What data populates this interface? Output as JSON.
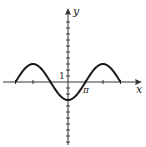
{
  "chart_data": {
    "type": "line",
    "title": "",
    "function": "y = -3 cos(x/2)",
    "xlabel": "x",
    "ylabel": "y",
    "x_tick_label": "π",
    "y_tick_label": "1",
    "xlim": [
      -3.5,
      4.0
    ],
    "ylim": [
      -7.5,
      7.2
    ],
    "x_tick_step_pi": 1,
    "y_tick_step": 1,
    "domain_pi": [
      -3,
      3
    ],
    "series": [
      {
        "name": "curve",
        "x_pi": [
          -3,
          -2,
          -1,
          0,
          1,
          2,
          3
        ],
        "values": [
          0,
          3,
          0,
          -3,
          0,
          3,
          0
        ]
      }
    ],
    "grid": false,
    "legend": "none",
    "colors": {
      "axis": "#333333",
      "curve": "#1a1a1a"
    }
  }
}
